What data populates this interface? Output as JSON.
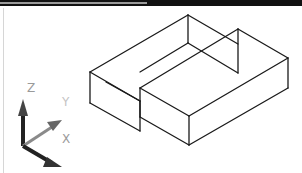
{
  "viewport": {
    "view": "isometric",
    "style": "wireframe",
    "line_color": "#1a1a1a",
    "background": "#ffffff"
  },
  "ucs_icon": {
    "z_label": "Z",
    "y_label": "Y",
    "x_label": "X",
    "z_color": "#222222",
    "y_color": "#8a8a8a",
    "x_color": "#222222",
    "label_color": "#9a9a9a"
  },
  "model": {
    "name": "stepped-slab-wireframe",
    "edges": [
      [
        90,
        72,
        188,
        15
      ],
      [
        90,
        72,
        90,
        103
      ],
      [
        90,
        72,
        140,
        101
      ],
      [
        188,
        15,
        238,
        44
      ],
      [
        188,
        15,
        188,
        43
      ],
      [
        90,
        103,
        140,
        131
      ],
      [
        140,
        101,
        140,
        131
      ],
      [
        188,
        43,
        140,
        72
      ],
      [
        140,
        88,
        238,
        29
      ],
      [
        238,
        29,
        288,
        58
      ],
      [
        238,
        29,
        238,
        73
      ],
      [
        140,
        88,
        140,
        117
      ],
      [
        140,
        88,
        189,
        116
      ],
      [
        189,
        116,
        288,
        58
      ],
      [
        189,
        116,
        189,
        145
      ],
      [
        288,
        58,
        288,
        88
      ],
      [
        189,
        145,
        288,
        88
      ],
      [
        140,
        117,
        189,
        145
      ],
      [
        188,
        43,
        238,
        73
      ],
      [
        106,
        82,
        140,
        101
      ]
    ]
  }
}
